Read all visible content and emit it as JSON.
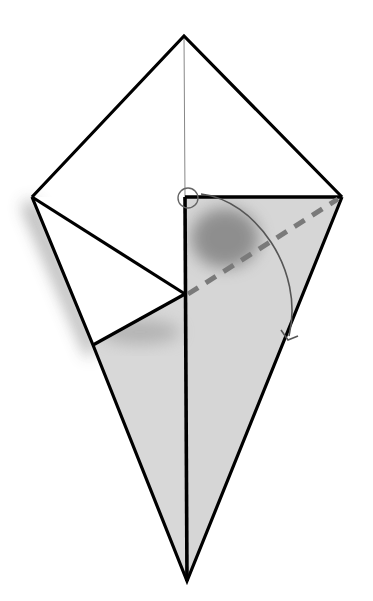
{
  "diagram": {
    "type": "origami-fold-step",
    "colors": {
      "background": "#ffffff",
      "outline": "#000000",
      "paper_back": "#d6d6d6",
      "shadow": "#8a8a8a",
      "fold_line": "#7a7a7a",
      "arrow": "#555555",
      "center_line": "#888888"
    },
    "points": {
      "top": [
        184,
        36
      ],
      "left": [
        32,
        197
      ],
      "right": [
        342,
        197
      ],
      "bottom": [
        187,
        581
      ],
      "center": [
        186,
        197
      ],
      "inner_mid": [
        185,
        294
      ],
      "lower_left": [
        93,
        345
      ]
    },
    "fold_line": {
      "style": "valley-dashed",
      "from": [
        186,
        294
      ],
      "to": [
        338,
        199
      ]
    },
    "arrow": {
      "kind": "fold-arrow",
      "from": [
        190,
        190
      ],
      "to": [
        288,
        338
      ]
    },
    "marker": {
      "kind": "pivot-circle",
      "at": [
        188,
        198
      ],
      "r": 10
    }
  }
}
